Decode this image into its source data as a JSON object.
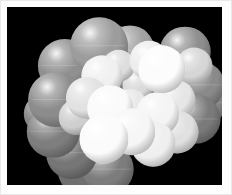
{
  "viewer": {
    "name": "molecular-structure-viewer",
    "background_color": "#000000",
    "frame_color": "#fdfdfd",
    "canvas": {
      "x": 7,
      "y": 7,
      "width": 215,
      "height": 178
    },
    "render_style": "space-filling-cpk",
    "light_direction": "upper-left"
  },
  "palette": {
    "gray_atom": "#9a9a9a",
    "gray_atom_dark": "#6f6f6f",
    "gray_atom_mid": "#8a8a8a",
    "white_atom": "#f2f2f2",
    "white_atom_bright": "#fcfcfc",
    "white_atom_shaded": "#dcdcdc",
    "background": "#000000"
  },
  "molecule": {
    "label": "space-filling-molecular-model",
    "atom_count": 33,
    "atoms": [
      {
        "id": "a01",
        "cx": 27.0,
        "cy": 33.0,
        "r": 12.6,
        "color": "#909090",
        "kind": "gray",
        "seam": true
      },
      {
        "id": "a02",
        "cx": 23.0,
        "cy": 52.0,
        "r": 13.0,
        "color": "#8c8c8c",
        "kind": "gray",
        "seam": true
      },
      {
        "id": "a03",
        "cx": 21.5,
        "cy": 70.0,
        "r": 12.2,
        "color": "#7e7e7e",
        "kind": "gray",
        "seam": true
      },
      {
        "id": "a04",
        "cx": 30.0,
        "cy": 82.0,
        "r": 12.0,
        "color": "#767676",
        "kind": "gray",
        "seam": true
      },
      {
        "id": "a05",
        "cx": 43.0,
        "cy": 22.0,
        "r": 13.4,
        "color": "#9c9c9c",
        "kind": "gray",
        "seam": true
      },
      {
        "id": "a06",
        "cx": 39.5,
        "cy": 41.0,
        "r": 11.0,
        "color": "#8f8f8f",
        "kind": "gray",
        "seam": false
      },
      {
        "id": "a07",
        "cx": 40.0,
        "cy": 62.0,
        "r": 11.6,
        "color": "#b6b6b6",
        "kind": "gray",
        "seam": true
      },
      {
        "id": "a08",
        "cx": 35.0,
        "cy": 92.0,
        "r": 11.2,
        "color": "#6f6f6f",
        "kind": "gray",
        "seam": false
      },
      {
        "id": "a09",
        "cx": 47.0,
        "cy": 91.0,
        "r": 11.8,
        "color": "#7c7c7c",
        "kind": "gray",
        "seam": true
      },
      {
        "id": "a10",
        "cx": 57.0,
        "cy": 24.0,
        "r": 11.4,
        "color": "#a2a2a2",
        "kind": "gray",
        "seam": true
      },
      {
        "id": "a11",
        "cx": 62.0,
        "cy": 43.0,
        "r": 12.4,
        "color": "#6b6b6b",
        "kind": "gray-dark",
        "seam": true
      },
      {
        "id": "a12",
        "cx": 83.0,
        "cy": 25.0,
        "r": 11.8,
        "color": "#8e8e8e",
        "kind": "gray",
        "seam": true
      },
      {
        "id": "a13",
        "cx": 90.0,
        "cy": 44.0,
        "r": 11.0,
        "color": "#8a8a8a",
        "kind": "gray",
        "seam": true
      },
      {
        "id": "a14",
        "cx": 88.0,
        "cy": 63.0,
        "r": 11.4,
        "color": "#7a7a7a",
        "kind": "gray",
        "seam": true
      },
      {
        "id": "a15",
        "cx": 44.0,
        "cy": 39.0,
        "r": 9.6,
        "color": "#f0f0f0",
        "kind": "white",
        "seam": false
      },
      {
        "id": "a16",
        "cx": 37.0,
        "cy": 51.0,
        "r": 9.8,
        "color": "#e2e2e2",
        "kind": "white",
        "seam": false
      },
      {
        "id": "a17",
        "cx": 48.0,
        "cy": 57.0,
        "r": 10.6,
        "color": "#fafafa",
        "kind": "white",
        "seam": true
      },
      {
        "id": "a18",
        "cx": 45.0,
        "cy": 74.0,
        "r": 11.4,
        "color": "#fbfbfb",
        "kind": "white",
        "seam": true
      },
      {
        "id": "a19",
        "cx": 58.0,
        "cy": 70.0,
        "r": 11.0,
        "color": "#f6f6f6",
        "kind": "white",
        "seam": true
      },
      {
        "id": "a20",
        "cx": 57.0,
        "cy": 56.0,
        "r": 8.4,
        "color": "#e8e8e8",
        "kind": "white",
        "seam": false
      },
      {
        "id": "a21",
        "cx": 66.0,
        "cy": 30.0,
        "r": 9.0,
        "color": "#ededed",
        "kind": "white",
        "seam": false
      },
      {
        "id": "a22",
        "cx": 70.0,
        "cy": 60.0,
        "r": 10.2,
        "color": "#f4f4f4",
        "kind": "white",
        "seam": false
      },
      {
        "id": "a23",
        "cx": 68.0,
        "cy": 77.0,
        "r": 10.4,
        "color": "#efefef",
        "kind": "white",
        "seam": true
      },
      {
        "id": "a24",
        "cx": 72.0,
        "cy": 35.0,
        "r": 11.0,
        "color": "#fcfcfc",
        "kind": "white",
        "seam": false
      },
      {
        "id": "a25",
        "cx": 78.0,
        "cy": 52.0,
        "r": 9.6,
        "color": "#e6e6e6",
        "kind": "white",
        "seam": false
      },
      {
        "id": "a26",
        "cx": 79.0,
        "cy": 70.0,
        "r": 10.0,
        "color": "#e0e0e0",
        "kind": "white",
        "seam": true
      },
      {
        "id": "a27",
        "cx": 61.0,
        "cy": 44.0,
        "r": 7.2,
        "color": "#dadada",
        "kind": "white",
        "seam": false
      },
      {
        "id": "a28",
        "cx": 52.0,
        "cy": 33.0,
        "r": 7.6,
        "color": "#dedede",
        "kind": "white",
        "seam": false
      },
      {
        "id": "a29",
        "cx": 87.0,
        "cy": 33.0,
        "r": 8.6,
        "color": "#d6d6d6",
        "kind": "white",
        "seam": false
      },
      {
        "id": "a30",
        "cx": 32.0,
        "cy": 62.0,
        "r": 8.0,
        "color": "#cfcfcf",
        "kind": "white",
        "seam": false
      },
      {
        "id": "a31",
        "cx": 50.0,
        "cy": 20.0,
        "r": 8.2,
        "color": "#a8a8a8",
        "kind": "gray",
        "seam": false
      },
      {
        "id": "a32",
        "cx": 17.0,
        "cy": 60.0,
        "r": 9.4,
        "color": "#888888",
        "kind": "gray",
        "seam": false
      },
      {
        "id": "a33",
        "cx": 93.0,
        "cy": 54.0,
        "r": 9.2,
        "color": "#858585",
        "kind": "gray",
        "seam": true
      }
    ]
  }
}
